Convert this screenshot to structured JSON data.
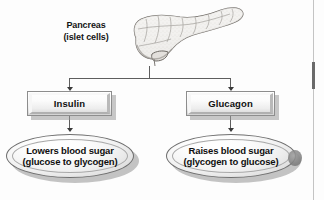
{
  "diagram": {
    "source_label": "Pancreas (islet cells) flow chart",
    "colors": {
      "line": "#5e5e5e",
      "arrowhead": "#3a3a3a",
      "box_border": "#8d8d8d",
      "ellipse_border": "#6f6f6f",
      "text": "#101010",
      "shadow": "#9a9a9a",
      "background": "#fdfdfd"
    },
    "organ": {
      "label_line1": "Pancreas",
      "label_line2": "(islet cells)",
      "icon_name": "pancreas-illustration"
    },
    "hormones": [
      {
        "id": "insulin",
        "label": "Insulin",
        "effect_line1": "Lowers blood sugar",
        "effect_line2": "(glucose to glycogen)"
      },
      {
        "id": "glucagon",
        "label": "Glucagon",
        "effect_line1": "Raises blood sugar",
        "effect_line2": "(glycogen to glucose)"
      }
    ]
  }
}
